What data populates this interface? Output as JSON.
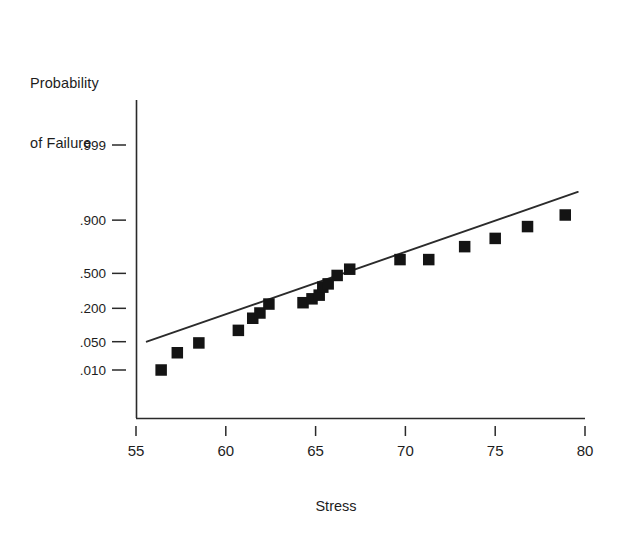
{
  "axis_labels": {
    "y_line1": "Probability",
    "y_line2": "of Failure",
    "x_title": "Stress"
  },
  "chart_data": {
    "type": "scatter",
    "title": "",
    "subtitle": "",
    "xlabel": "Stress",
    "ylabel": "Probability of Failure",
    "grid": false,
    "legend": "none",
    "xlim": [
      55,
      80
    ],
    "x_ticks": [
      "55",
      "60",
      "65",
      "70",
      "75",
      "80"
    ],
    "y_scale": "lognormal-probability",
    "y_ticks": [
      ".999",
      ".900",
      ".500",
      ".200",
      ".050",
      ".010"
    ],
    "y_tick_values": [
      0.999,
      0.9,
      0.5,
      0.2,
      0.05,
      0.01
    ],
    "series": [
      {
        "name": "Observed failures",
        "marker": "filled-square",
        "color": "#141414",
        "x": [
          56.4,
          57.3,
          58.5,
          60.7,
          61.5,
          61.9,
          62.4,
          64.3,
          64.8,
          65.2,
          65.4,
          65.7,
          66.2,
          66.9,
          69.7,
          71.3,
          73.3,
          75.0,
          76.8,
          78.9
        ],
        "y": [
          0.01,
          0.028,
          0.047,
          0.085,
          0.14,
          0.17,
          0.23,
          0.24,
          0.27,
          0.3,
          0.37,
          0.4,
          0.48,
          0.54,
          0.63,
          0.63,
          0.74,
          0.8,
          0.87,
          0.92
        ]
      },
      {
        "name": "Fitted distribution line",
        "marker": "none",
        "color": "#2b2b2b",
        "x": [
          55.6,
          79.6
        ],
        "y": [
          0.05,
          0.975
        ]
      }
    ]
  }
}
